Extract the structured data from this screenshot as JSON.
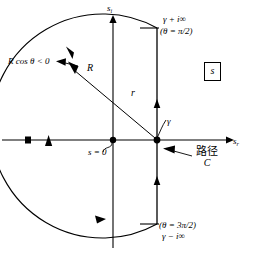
{
  "figure": {
    "type": "complex-plane-bromwich-contour-diagram",
    "axes": {
      "imaginary_axis_label": "s",
      "imaginary_axis_subscript": "i",
      "real_axis_label": "s",
      "real_axis_subscript": "r"
    },
    "labels": {
      "gamma_plus_i_infinity": "γ + i∞",
      "theta_pi_over_2": "(θ = π/2)",
      "theta_3pi_over_2": "(θ = 3π/2)",
      "gamma_minus_i_infinity": "γ − i∞",
      "r_cos_theta": "R cos θ < 0",
      "radius_R": "R",
      "radius_r": "r",
      "gamma_point": "γ",
      "s_equals_zero": "s = 0",
      "path_name": "路径",
      "path_letter": "C",
      "plane_box_label": "s"
    },
    "geometry": {
      "origin_x": 113,
      "origin_y": 140,
      "gamma_x": 157,
      "gamma_y": 140,
      "arc_radius": 140,
      "vertical_line_top_y": 28,
      "vertical_line_bottom_y": 224,
      "stroke_color": "#000000",
      "background_color": "#ffffff"
    },
    "arrow_directions": {
      "upper_arc": "counterclockwise-up-left",
      "left_arc_crossing": "down",
      "lower_arc": "toward-lower-right",
      "upper_vertical": "upward",
      "lower_vertical": "upward"
    }
  }
}
